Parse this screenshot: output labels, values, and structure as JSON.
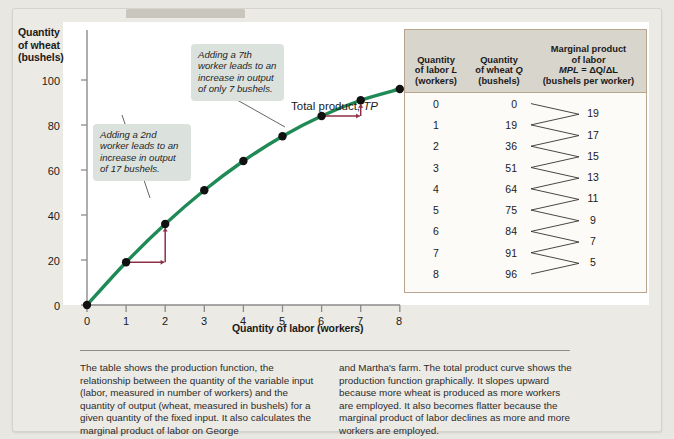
{
  "figure": {
    "y_axis_title": "Quantity\nof wheat\n(bushels)",
    "y_axis_title_lines": [
      "Quantity",
      "of wheat",
      "(bushels)"
    ],
    "x_axis_title": "Quantity of labor (workers)",
    "curve_label_prefix": "Total product, ",
    "curve_label_italic": "TP",
    "callout_2nd": "Adding a 2nd worker leads to an increase in output of 17 bushels.",
    "callout_7th": "Adding a 7th worker leads to an increase in output of only 7 bushels."
  },
  "colors": {
    "curve": "#1f8a56",
    "point": "#111111",
    "arrow": "#8c2f46",
    "callout_bg": "#dbe2dd",
    "table_border": "#b9a48d",
    "table_header_bg": "#d8d5cd",
    "page_bg": "#e9e7e1",
    "panel_bg": "#eceae4"
  },
  "table": {
    "headers": {
      "labor_l1": "Quantity",
      "labor_l2": "of labor ",
      "labor_l2_italic": "L",
      "labor_l3": "(workers)",
      "wheat_l1": "Quantity",
      "wheat_l2": "of wheat ",
      "wheat_l2_italic": "Q",
      "wheat_l3": "(bushels)",
      "mpl_l1": "Marginal product",
      "mpl_l2": "of labor",
      "mpl_l3_italic": "MPL",
      "mpl_l3_rest": " = ΔQ/ΔL",
      "mpl_l4": "(bushels per worker)"
    },
    "rows": [
      {
        "l": "0",
        "q": "0"
      },
      {
        "l": "1",
        "q": "19"
      },
      {
        "l": "2",
        "q": "36"
      },
      {
        "l": "3",
        "q": "51"
      },
      {
        "l": "4",
        "q": "64"
      },
      {
        "l": "5",
        "q": "75"
      },
      {
        "l": "6",
        "q": "84"
      },
      {
        "l": "7",
        "q": "91"
      },
      {
        "l": "8",
        "q": "96"
      }
    ],
    "mpl_values": [
      "19",
      "17",
      "15",
      "13",
      "11",
      "9",
      "7",
      "5"
    ]
  },
  "caption": {
    "left": "The table shows the production function, the relationship between the quantity of the variable input (labor, measured in number of workers) and the quantity of output (wheat, measured in bushels) for a given quantity of the fixed input. It also calculates the marginal product of labor on George",
    "right": "and Martha's farm. The total product curve shows the production function graphically. It slopes upward because more wheat is produced as more workers are employed. It also becomes flatter because the marginal product of labor declines as more and more workers are employed."
  },
  "chart_data": {
    "type": "line",
    "title": "",
    "xlabel": "Quantity of labor (workers)",
    "ylabel": "Quantity of wheat (bushels)",
    "x": [
      0,
      1,
      2,
      3,
      4,
      5,
      6,
      7,
      8
    ],
    "y": [
      0,
      19,
      36,
      51,
      64,
      75,
      84,
      91,
      96
    ],
    "series": [
      {
        "name": "Total product, TP",
        "values": [
          0,
          19,
          36,
          51,
          64,
          75,
          84,
          91,
          96
        ]
      }
    ],
    "marginal_product_of_labor": [
      19,
      17,
      15,
      13,
      11,
      9,
      7,
      5
    ],
    "xlim": [
      0,
      8
    ],
    "ylim": [
      0,
      110
    ],
    "xticks": [
      0,
      1,
      2,
      3,
      4,
      5,
      6,
      7,
      8
    ],
    "yticks": [
      0,
      20,
      40,
      60,
      80,
      100
    ],
    "grid": false,
    "legend": "none",
    "annotations": [
      {
        "text": "Adding a 2nd worker leads to an increase in output of 17 bushels.",
        "points_to_x": 2,
        "points_to_y": 36
      },
      {
        "text": "Adding a 7th worker leads to an increase in output of only 7 bushels.",
        "points_to_x": 7,
        "points_to_y": 91
      }
    ],
    "step_arrows": [
      {
        "from_x": 1,
        "from_y": 19,
        "to_x": 2,
        "to_y": 36
      },
      {
        "from_x": 6,
        "from_y": 84,
        "to_x": 7,
        "to_y": 91
      }
    ]
  }
}
